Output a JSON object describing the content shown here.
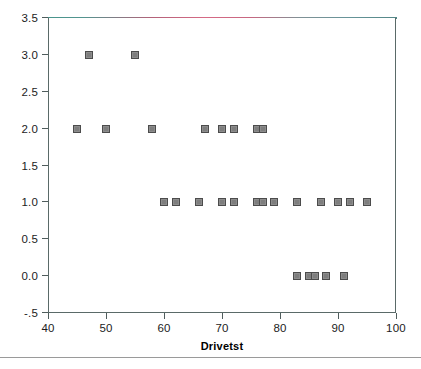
{
  "chart_data": {
    "type": "scatter",
    "title": "",
    "xlabel": "Drivetst",
    "ylabel": "",
    "xlim": [
      40,
      100
    ],
    "ylim": [
      -0.5,
      3.5
    ],
    "xticks": [
      40,
      50,
      60,
      70,
      80,
      90,
      100
    ],
    "xtick_labels": [
      "40",
      "50",
      "60",
      "70",
      "80",
      "90",
      "100"
    ],
    "yticks": [
      3.5,
      3.0,
      2.5,
      2.0,
      1.5,
      1.0,
      0.5,
      0.0,
      -0.5
    ],
    "ytick_labels": [
      "3.5",
      "3.0",
      "2.5",
      "2.0",
      "1.5",
      "1.0",
      "0.5",
      "0.0",
      "-.5"
    ],
    "grid": false,
    "legend": null,
    "marker": {
      "shape": "square",
      "fill_color": "#8d8d8d",
      "edge_color": "#4c4c4c",
      "size_px": 8
    },
    "frame_color": "#5a6a68",
    "points": [
      {
        "x": 47,
        "y": 3.0
      },
      {
        "x": 55,
        "y": 3.0
      },
      {
        "x": 45,
        "y": 2.0
      },
      {
        "x": 50,
        "y": 2.0
      },
      {
        "x": 58,
        "y": 2.0
      },
      {
        "x": 67,
        "y": 2.0
      },
      {
        "x": 70,
        "y": 2.0
      },
      {
        "x": 72,
        "y": 2.0
      },
      {
        "x": 76,
        "y": 2.0
      },
      {
        "x": 77,
        "y": 2.0
      },
      {
        "x": 60,
        "y": 1.0
      },
      {
        "x": 62,
        "y": 1.0
      },
      {
        "x": 66,
        "y": 1.0
      },
      {
        "x": 70,
        "y": 1.0
      },
      {
        "x": 72,
        "y": 1.0
      },
      {
        "x": 76,
        "y": 1.0
      },
      {
        "x": 77,
        "y": 1.0
      },
      {
        "x": 79,
        "y": 1.0
      },
      {
        "x": 83,
        "y": 1.0
      },
      {
        "x": 87,
        "y": 1.0
      },
      {
        "x": 90,
        "y": 1.0
      },
      {
        "x": 92,
        "y": 1.0
      },
      {
        "x": 95,
        "y": 1.0
      },
      {
        "x": 83,
        "y": 0.0
      },
      {
        "x": 85,
        "y": 0.0
      },
      {
        "x": 86,
        "y": 0.0
      },
      {
        "x": 88,
        "y": 0.0
      },
      {
        "x": 91,
        "y": 0.0
      }
    ]
  }
}
